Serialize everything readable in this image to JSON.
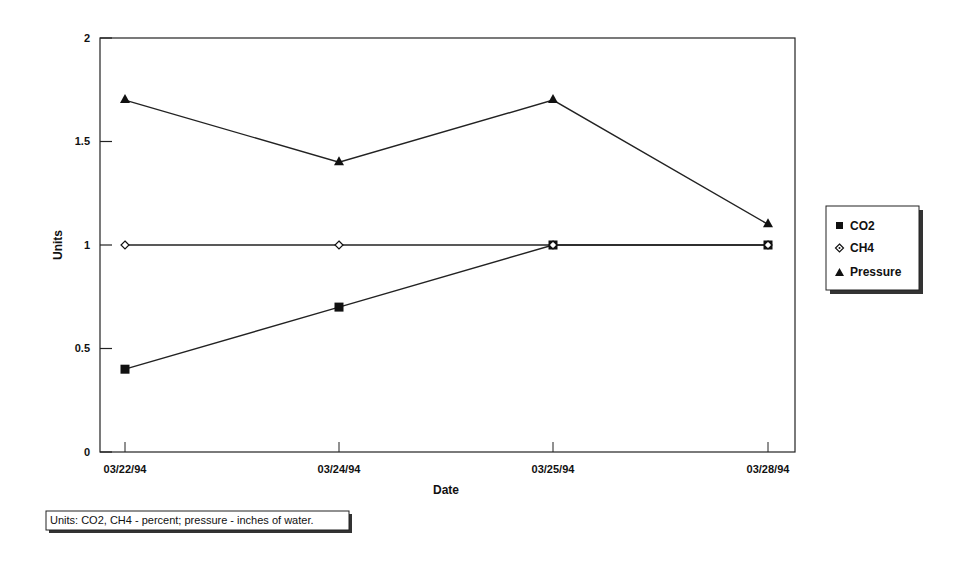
{
  "chart_data": {
    "type": "line",
    "title": "",
    "xlabel": "Date",
    "ylabel": "Units",
    "categories": [
      "03/22/94",
      "03/24/94",
      "03/25/94",
      "03/28/94"
    ],
    "ylim": [
      0,
      2
    ],
    "yticks": [
      "0",
      "0.5",
      "1",
      "1.5",
      "2"
    ],
    "grid": false,
    "legend_position": "right",
    "series": [
      {
        "name": "CO2",
        "marker": "filled-square",
        "values": [
          0.4,
          0.7,
          1.0,
          1.0
        ]
      },
      {
        "name": "CH4",
        "marker": "open-diamond",
        "values": [
          1.0,
          1.0,
          1.0,
          1.0
        ]
      },
      {
        "name": "Pressure",
        "marker": "filled-triangle",
        "values": [
          1.7,
          1.4,
          1.7,
          1.1
        ]
      }
    ],
    "annotations": [
      "Units: CO2, CH4 - percent; pressure - inches of water."
    ]
  },
  "axes": {
    "x_title": "Date",
    "y_title": "Units",
    "x_ticks": [
      "03/22/94",
      "03/24/94",
      "03/25/94",
      "03/28/94"
    ],
    "y_ticks": [
      "0",
      "0.5",
      "1",
      "1.5",
      "2"
    ]
  },
  "legend": {
    "items": [
      {
        "label": "CO2"
      },
      {
        "label": "CH4"
      },
      {
        "label": "Pressure"
      }
    ]
  },
  "note": {
    "text": "Units: CO2, CH4 - percent; pressure - inches of water."
  }
}
